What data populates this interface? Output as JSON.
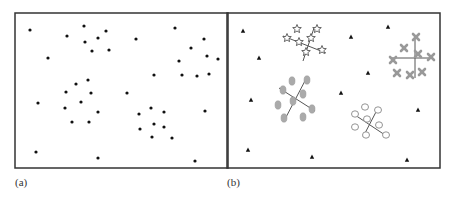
{
  "figure": {
    "panel_a": {
      "label": "(a)",
      "frame": {
        "x": 15,
        "y": 13,
        "w": 213,
        "h": 155
      },
      "dots": [
        [
          30,
          30
        ],
        [
          67,
          36
        ],
        [
          84,
          26
        ],
        [
          98,
          38
        ],
        [
          106,
          31
        ],
        [
          85,
          42
        ],
        [
          92,
          51
        ],
        [
          109,
          50
        ],
        [
          48,
          58
        ],
        [
          136,
          39
        ],
        [
          175,
          28
        ],
        [
          191,
          48
        ],
        [
          204,
          39
        ],
        [
          207,
          56
        ],
        [
          218,
          59
        ],
        [
          179,
          61
        ],
        [
          182,
          75
        ],
        [
          197,
          76
        ],
        [
          209,
          74
        ],
        [
          154,
          75
        ],
        [
          88,
          80
        ],
        [
          76,
          84
        ],
        [
          66,
          92
        ],
        [
          91,
          93
        ],
        [
          38,
          103
        ],
        [
          65,
          108
        ],
        [
          81,
          102
        ],
        [
          98,
          112
        ],
        [
          127,
          93
        ],
        [
          72,
          122
        ],
        [
          89,
          122
        ],
        [
          139,
          114
        ],
        [
          151,
          108
        ],
        [
          164,
          112
        ],
        [
          140,
          129
        ],
        [
          154,
          124
        ],
        [
          164,
          127
        ],
        [
          152,
          137
        ],
        [
          172,
          138
        ],
        [
          205,
          111
        ],
        [
          36,
          152
        ],
        [
          98,
          158
        ],
        [
          195,
          161
        ]
      ]
    },
    "panel_b": {
      "label": "(b)",
      "frame": {
        "x": 227,
        "y": 13,
        "w": 213,
        "h": 155
      },
      "triangles": [
        [
          243,
          31
        ],
        [
          259,
          58
        ],
        [
          251,
          100
        ],
        [
          248,
          150
        ],
        [
          312,
          157
        ],
        [
          351,
          37
        ],
        [
          388,
          27
        ],
        [
          368,
          73
        ],
        [
          341,
          93
        ],
        [
          418,
          110
        ],
        [
          407,
          160
        ]
      ],
      "clusters": [
        {
          "name": "stars",
          "symbol": "star",
          "color": "#555555",
          "points": [
            [
              297,
              29
            ],
            [
              317,
              29
            ],
            [
              287,
              38
            ],
            [
              299,
              42
            ],
            [
              311,
              38
            ],
            [
              306,
              52
            ],
            [
              322,
              50
            ]
          ],
          "axes": [
            [
              283,
              36,
              326,
              53
            ],
            [
              314,
              28,
              303,
              61
            ]
          ]
        },
        {
          "name": "crosses",
          "symbol": "cross",
          "color": "#999999",
          "points": [
            [
              416,
              37
            ],
            [
              404,
              48
            ],
            [
              418,
              54
            ],
            [
              431,
              57
            ],
            [
              393,
              60
            ],
            [
              397,
              73
            ],
            [
              410,
              75
            ],
            [
              422,
              72
            ]
          ],
          "axes": [
            [
              391,
              58,
              433,
              58
            ],
            [
              415,
              35,
              415,
              78
            ]
          ]
        },
        {
          "name": "ovals",
          "symbol": "filled-oval",
          "color": "#aaaaaa",
          "points": [
            [
              292,
              81
            ],
            [
              307,
              80
            ],
            [
              283,
              90
            ],
            [
              303,
              94
            ],
            [
              278,
              105
            ],
            [
              293,
              101
            ],
            [
              312,
              109
            ],
            [
              284,
              118
            ],
            [
              303,
              117
            ]
          ],
          "axes": [
            [
              279,
              88,
              315,
              111
            ],
            [
              307,
              77,
              284,
              121
            ]
          ]
        },
        {
          "name": "circles",
          "symbol": "hollow-circle",
          "color": "#888888",
          "points": [
            [
              365,
              107
            ],
            [
              378,
              110
            ],
            [
              355,
              114
            ],
            [
              367,
              119
            ],
            [
              379,
              125
            ],
            [
              355,
              127
            ],
            [
              366,
              135
            ],
            [
              386,
              135
            ]
          ],
          "axes": [
            [
              352,
              113,
              388,
              137
            ],
            [
              377,
              110,
              363,
              137
            ]
          ]
        }
      ]
    }
  }
}
